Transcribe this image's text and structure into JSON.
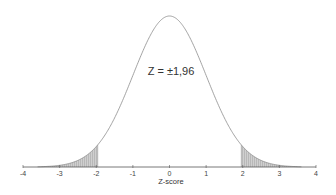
{
  "chart_data": {
    "type": "area",
    "title": "",
    "xlabel": "Z-score",
    "ylabel": "",
    "xlim": [
      -4,
      4
    ],
    "ylim": [
      0,
      0.4
    ],
    "grid": false,
    "legend": null,
    "x_ticks": [
      -4,
      -3,
      -2,
      -1,
      0,
      1,
      2,
      3,
      4
    ],
    "x_tick_labels": [
      "-4",
      "-3",
      "-2",
      "-1",
      "0",
      "1",
      "2",
      "3",
      "4"
    ],
    "series": [
      {
        "name": "Standard normal density",
        "distribution": "normal",
        "mean": 0,
        "sd": 1,
        "x": [
          -4,
          -3.5,
          -3,
          -2.5,
          -2,
          -1.5,
          -1,
          -0.5,
          0,
          0.5,
          1,
          1.5,
          2,
          2.5,
          3,
          3.5,
          4
        ],
        "values": [
          0.0001,
          0.0009,
          0.0044,
          0.0175,
          0.054,
          0.1295,
          0.242,
          0.3521,
          0.3989,
          0.3521,
          0.242,
          0.1295,
          0.054,
          0.0175,
          0.0044,
          0.0009,
          0.0001
        ]
      }
    ],
    "shaded_regions": [
      {
        "name": "left-tail",
        "from": -4,
        "to": -1.96
      },
      {
        "name": "right-tail",
        "from": 1.96,
        "to": 4
      }
    ],
    "annotations": [
      {
        "text": "Z = ±1,96",
        "x": 0,
        "y": 0.28
      }
    ]
  },
  "labels": {
    "annotation": "Z = ±1,96",
    "xlabel": "Z-score",
    "ticks": [
      "-4",
      "-3",
      "-2",
      "-1",
      "0",
      "1",
      "2",
      "3",
      "4"
    ]
  },
  "colors": {
    "curve": "#8c8c8c",
    "shade": "#c8c8c8",
    "hatch": "#9a9a9a",
    "axis": "#555555"
  }
}
